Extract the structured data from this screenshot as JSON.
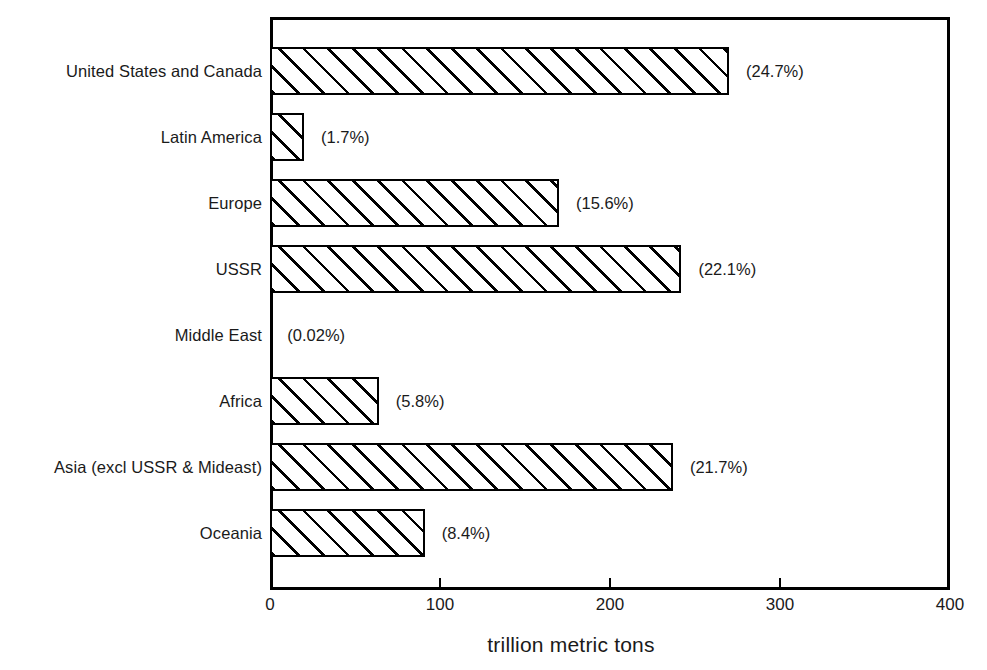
{
  "chart_data": {
    "type": "bar",
    "orientation": "horizontal",
    "title": "",
    "subtitle": "",
    "xlabel": "trillion metric tons",
    "ylabel": "",
    "xlim": [
      0,
      400
    ],
    "xticks": [
      0,
      100,
      200,
      300,
      400
    ],
    "xticklabels": [
      "0",
      "100",
      "200",
      "300",
      "400"
    ],
    "grid": false,
    "legend": false,
    "categories": [
      "United States and Canada",
      "Latin America",
      "Europe",
      "USSR",
      "Middle East",
      "Africa",
      "Asia (excl USSR & Mideast)",
      "Oceania"
    ],
    "values": [
      270,
      20,
      170,
      242,
      0.2,
      64,
      237,
      91
    ],
    "annotations": [
      "(24.7%)",
      "(1.7%)",
      "(15.6%)",
      "(22.1%)",
      "(0.02%)",
      "(5.8%)",
      "(21.7%)",
      "(8.4%)"
    ],
    "bars": [
      {
        "category": "United States and Canada",
        "value": 270,
        "percent": "(24.7%)"
      },
      {
        "category": "Latin America",
        "value": 20,
        "percent": "(1.7%)"
      },
      {
        "category": "Europe",
        "value": 170,
        "percent": "(15.6%)"
      },
      {
        "category": "USSR",
        "value": 242,
        "percent": "(22.1%)"
      },
      {
        "category": "Middle East",
        "value": 0.2,
        "percent": "(0.02%)"
      },
      {
        "category": "Africa",
        "value": 64,
        "percent": "(5.8%)"
      },
      {
        "category": "Asia (excl USSR & Mideast)",
        "value": 237,
        "percent": "(21.7%)"
      },
      {
        "category": "Oceania",
        "value": 91,
        "percent": "(8.4%)"
      }
    ],
    "style": {
      "bar_fill": "#ffffff",
      "bar_edge": "#000000",
      "hatch": "diagonal-45",
      "background": "#ffffff",
      "text_color": "#1a1a1a"
    }
  }
}
